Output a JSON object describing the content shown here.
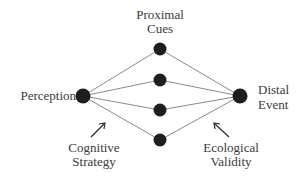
{
  "diagram": {
    "labels": {
      "proximal_line1": "Proximal",
      "proximal_line2": "Cues",
      "perception": "Perception",
      "distal_line1": "Distal",
      "distal_line2": "Event",
      "cognitive_line1": "Cognitive",
      "cognitive_line2": "Strategy",
      "ecological_line1": "Ecological",
      "ecological_line2": "Validity"
    },
    "nodes": [
      {
        "id": "perception",
        "role": "left"
      },
      {
        "id": "cue-1",
        "role": "cue"
      },
      {
        "id": "cue-2",
        "role": "cue"
      },
      {
        "id": "cue-3",
        "role": "cue"
      },
      {
        "id": "cue-4",
        "role": "cue"
      },
      {
        "id": "distal-event",
        "role": "right"
      }
    ],
    "edges": [
      [
        "perception",
        "cue-1"
      ],
      [
        "perception",
        "cue-2"
      ],
      [
        "perception",
        "cue-3"
      ],
      [
        "perception",
        "cue-4"
      ],
      [
        "cue-1",
        "distal-event"
      ],
      [
        "cue-2",
        "distal-event"
      ],
      [
        "cue-3",
        "distal-event"
      ],
      [
        "cue-4",
        "distal-event"
      ]
    ],
    "colors": {
      "node": "#1e1e1e",
      "edge": "#8a8a8a",
      "text": "#3a3a3a"
    }
  }
}
